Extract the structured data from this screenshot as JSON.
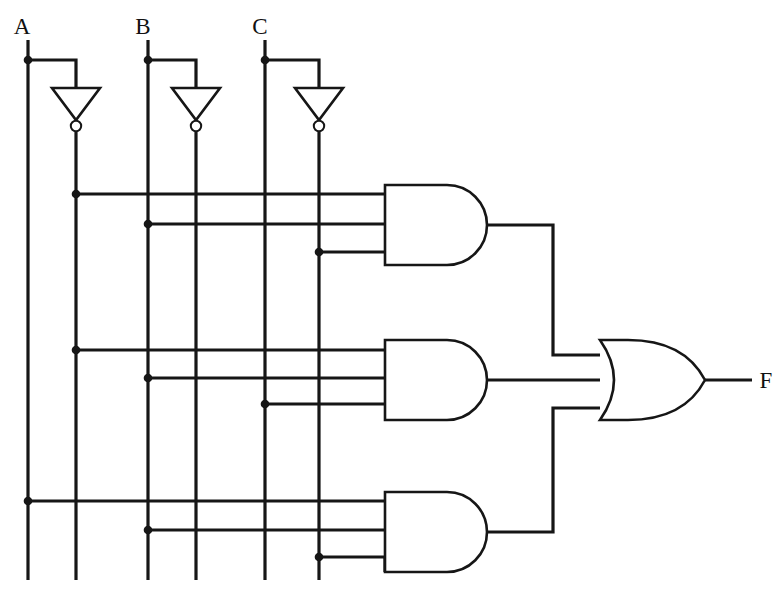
{
  "diagram": {
    "type": "logic-gate-schematic",
    "background_color": "#ffffff",
    "wire_color": "#161616",
    "inputs": [
      {
        "id": "A",
        "label": "A",
        "x": 28,
        "top_y": 40,
        "tap_y": 60
      },
      {
        "id": "B",
        "label": "B",
        "x": 148,
        "top_y": 40,
        "tap_y": 60
      },
      {
        "id": "C",
        "label": "C",
        "x": 265,
        "top_y": 40,
        "tap_y": 60
      }
    ],
    "output": {
      "id": "F",
      "label": "F",
      "x": 760,
      "y": 380
    },
    "inverters": [
      {
        "id": "inv-a",
        "input_label": "A",
        "output_label": "A-bar",
        "apex_x": 76,
        "top_y": 88,
        "bottom_y": 120,
        "half_width": 24,
        "bubble_y": 126
      },
      {
        "id": "inv-b",
        "input_label": "B",
        "output_label": "B-bar",
        "apex_x": 196,
        "top_y": 88,
        "bottom_y": 120,
        "half_width": 24,
        "bubble_y": 126
      },
      {
        "id": "inv-c",
        "input_label": "C",
        "output_label": "C-bar",
        "apex_x": 319,
        "top_y": 88,
        "bottom_y": 120,
        "half_width": 24,
        "bubble_y": 126
      }
    ],
    "rails": [
      {
        "id": "rail-a",
        "label": "A",
        "x": 28
      },
      {
        "id": "rail-a-bar",
        "label": "A-bar",
        "x": 76
      },
      {
        "id": "rail-b",
        "label": "B",
        "x": 148
      },
      {
        "id": "rail-b-bar",
        "label": "B-bar",
        "x": 196
      },
      {
        "id": "rail-c",
        "label": "C",
        "x": 265
      },
      {
        "id": "rail-c-bar",
        "label": "C-bar",
        "x": 319
      }
    ],
    "and_gates": [
      {
        "id": "and-1",
        "label": "AND gate 1",
        "left_x": 385,
        "right_x": 490,
        "top_y": 185,
        "bottom_y": 265,
        "output_y": 225,
        "inputs": [
          {
            "y": 194,
            "from_rail": "A-bar",
            "from_x": 76,
            "junction": true
          },
          {
            "y": 224,
            "from_rail": "B-bar",
            "from_x": 148,
            "junction": true
          },
          {
            "y": 252,
            "from_rail": "C-bar",
            "from_x": 319,
            "junction": true
          }
        ]
      },
      {
        "id": "and-2",
        "label": "AND gate 2",
        "left_x": 385,
        "right_x": 490,
        "top_y": 340,
        "bottom_y": 420,
        "output_y": 380,
        "inputs": [
          {
            "y": 350,
            "from_rail": "A-bar",
            "from_x": 76,
            "junction": true
          },
          {
            "y": 378,
            "from_rail": "B",
            "from_x": 148,
            "junction": true
          },
          {
            "y": 404,
            "from_rail": "C",
            "from_x": 265,
            "junction": true
          }
        ]
      },
      {
        "id": "and-3",
        "label": "AND gate 3",
        "left_x": 385,
        "right_x": 490,
        "top_y": 492,
        "bottom_y": 572,
        "output_y": 532,
        "inputs": [
          {
            "y": 501,
            "from_rail": "A",
            "from_x": 28,
            "junction": true
          },
          {
            "y": 530,
            "from_rail": "B",
            "from_x": 148,
            "junction": true
          },
          {
            "y": 557,
            "from_rail": "C-bar",
            "from_x": 319,
            "junction": true
          }
        ]
      }
    ],
    "or_gate": {
      "id": "or-1",
      "label": "OR gate",
      "left_x": 600,
      "right_x": 705,
      "top_y": 340,
      "bottom_y": 420,
      "output_y": 380,
      "inputs": [
        {
          "y": 355,
          "from_gate": "and-1"
        },
        {
          "y": 380,
          "from_gate": "and-2"
        },
        {
          "y": 408,
          "from_gate": "and-3"
        }
      ]
    },
    "bus_x": 553
  }
}
